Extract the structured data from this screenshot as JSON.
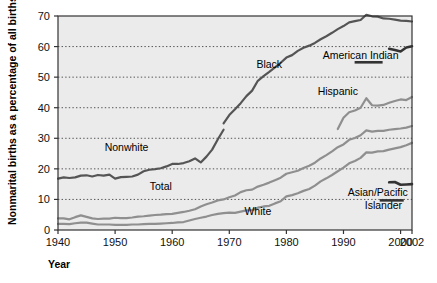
{
  "chart_data": {
    "type": "line",
    "title": "",
    "xlabel": "Year",
    "ylabel": "Nonmarital births as a percentage of all births",
    "xlim": [
      1940,
      2002
    ],
    "ylim": [
      0,
      70
    ],
    "xticks": [
      1940,
      1950,
      1960,
      1970,
      1980,
      1990,
      2000,
      2002
    ],
    "xticklabels": [
      "1940",
      "1950",
      "1960",
      "1970",
      "1980",
      "1990",
      "2000",
      "2002"
    ],
    "yticks": [
      0,
      10,
      20,
      30,
      40,
      50,
      60,
      70
    ],
    "yticklabels": [
      "0",
      "10",
      "20",
      "30",
      "40",
      "50",
      "60",
      "70"
    ],
    "grid": "horizontal-dotted",
    "legend_position": "inline-annotations",
    "plot_background": "#ebebeb",
    "series": [
      {
        "name": "Black",
        "color": "#555555",
        "label_x": 1977,
        "label_y": 53,
        "x": [
          1969,
          1970,
          1971,
          1972,
          1973,
          1974,
          1975,
          1976,
          1977,
          1978,
          1979,
          1980,
          1981,
          1982,
          1983,
          1984,
          1985,
          1986,
          1987,
          1988,
          1989,
          1990,
          1991,
          1992,
          1993,
          1994,
          1995,
          1996,
          1997,
          1998,
          1999,
          2000,
          2001,
          2002
        ],
        "values": [
          34.9,
          37.6,
          39.5,
          41.5,
          43.8,
          45.6,
          48.8,
          50.3,
          51.7,
          53.2,
          54.7,
          56.4,
          57.2,
          58.6,
          59.6,
          60.3,
          61.2,
          62.4,
          63.4,
          64.5,
          65.7,
          66.7,
          67.9,
          68.3,
          68.7,
          70.4,
          69.9,
          69.8,
          69.2,
          69.1,
          68.8,
          68.5,
          68.4,
          68.2
        ]
      },
      {
        "name": "Nonwhite",
        "color": "#555555",
        "label_x": 1952,
        "label_y": 26,
        "x": [
          1940,
          1941,
          1942,
          1943,
          1944,
          1945,
          1946,
          1947,
          1948,
          1949,
          1950,
          1951,
          1952,
          1953,
          1954,
          1955,
          1956,
          1957,
          1958,
          1959,
          1960,
          1961,
          1962,
          1963,
          1964,
          1965,
          1966,
          1967,
          1968,
          1969
        ],
        "values": [
          16.8,
          17.2,
          17.0,
          17.2,
          17.8,
          17.9,
          17.5,
          18.0,
          17.8,
          18.1,
          16.8,
          17.3,
          17.4,
          17.5,
          18.1,
          19.2,
          19.7,
          19.9,
          20.2,
          20.8,
          21.6,
          21.6,
          21.9,
          22.5,
          23.4,
          22.1,
          24.0,
          26.3,
          29.7,
          32.8
        ]
      },
      {
        "name": "Hispanic",
        "color": "#8f8f8f",
        "label_x": 1989,
        "label_y": 44,
        "x": [
          1989,
          1990,
          1991,
          1992,
          1993,
          1994,
          1995,
          1996,
          1997,
          1998,
          1999,
          2000,
          2001,
          2002
        ],
        "values": [
          33.0,
          36.7,
          38.5,
          39.1,
          40.0,
          43.1,
          40.8,
          40.7,
          40.9,
          41.6,
          42.2,
          42.7,
          42.5,
          43.5
        ]
      },
      {
        "name": "American Indian",
        "color": "#333333",
        "label_x": 1993,
        "label_y": 56,
        "x": [
          1998,
          1999,
          2000,
          2001,
          2002
        ],
        "values": [
          59.3,
          58.9,
          58.4,
          59.7,
          60.1
        ]
      },
      {
        "name": "Total",
        "color": "#8f8f8f",
        "label_x": 1958,
        "label_y": 13,
        "x": [
          1940,
          1941,
          1942,
          1943,
          1944,
          1945,
          1946,
          1947,
          1948,
          1949,
          1950,
          1951,
          1952,
          1953,
          1954,
          1955,
          1956,
          1957,
          1958,
          1959,
          1960,
          1961,
          1962,
          1963,
          1964,
          1965,
          1966,
          1967,
          1968,
          1969,
          1970,
          1971,
          1972,
          1973,
          1974,
          1975,
          1976,
          1977,
          1978,
          1979,
          1980,
          1981,
          1982,
          1983,
          1984,
          1985,
          1986,
          1987,
          1988,
          1989,
          1990,
          1991,
          1992,
          1993,
          1994,
          1995,
          1996,
          1997,
          1998,
          1999,
          2000,
          2001,
          2002
        ],
        "values": [
          3.8,
          3.8,
          3.5,
          4.2,
          4.8,
          4.3,
          3.8,
          3.6,
          3.7,
          3.7,
          4.0,
          3.9,
          3.9,
          4.1,
          4.4,
          4.5,
          4.7,
          4.9,
          5.0,
          5.2,
          5.3,
          5.6,
          5.9,
          6.3,
          6.8,
          7.7,
          8.4,
          9.0,
          9.7,
          10.0,
          10.7,
          11.3,
          12.4,
          13.0,
          13.2,
          14.2,
          14.8,
          15.5,
          16.3,
          17.1,
          18.4,
          18.9,
          19.4,
          20.3,
          21.0,
          22.0,
          23.4,
          24.5,
          25.7,
          27.1,
          28.0,
          29.5,
          30.1,
          31.0,
          32.6,
          32.2,
          32.4,
          32.4,
          32.8,
          33.0,
          33.2,
          33.5,
          34.0
        ]
      },
      {
        "name": "White",
        "color": "#8f8f8f",
        "label_x": 1975,
        "label_y": 5,
        "x": [
          1940,
          1941,
          1942,
          1943,
          1944,
          1945,
          1946,
          1947,
          1948,
          1949,
          1950,
          1951,
          1952,
          1953,
          1954,
          1955,
          1956,
          1957,
          1958,
          1959,
          1960,
          1961,
          1962,
          1963,
          1964,
          1965,
          1966,
          1967,
          1968,
          1969,
          1970,
          1971,
          1972,
          1973,
          1974,
          1975,
          1976,
          1977,
          1978,
          1979,
          1980,
          1981,
          1982,
          1983,
          1984,
          1985,
          1986,
          1987,
          1988,
          1989,
          1990,
          1991,
          1992,
          1993,
          1994,
          1995,
          1996,
          1997,
          1998,
          1999,
          2000,
          2001,
          2002
        ],
        "values": [
          2.0,
          2.0,
          1.9,
          2.2,
          2.4,
          2.4,
          2.1,
          1.8,
          1.8,
          1.8,
          1.7,
          1.7,
          1.7,
          1.8,
          1.8,
          1.9,
          2.0,
          2.0,
          2.1,
          2.2,
          2.3,
          2.5,
          2.6,
          3.1,
          3.6,
          4.0,
          4.4,
          4.9,
          5.3,
          5.5,
          5.7,
          5.6,
          6.0,
          6.4,
          6.5,
          7.3,
          7.7,
          7.9,
          8.7,
          9.4,
          11.0,
          11.4,
          12.0,
          12.8,
          13.4,
          14.5,
          15.9,
          16.9,
          18.0,
          19.2,
          20.4,
          21.8,
          22.6,
          23.6,
          25.4,
          25.3,
          25.7,
          25.8,
          26.3,
          26.7,
          27.1,
          27.7,
          28.5
        ]
      },
      {
        "name": "Asian/Pacific Islander",
        "color": "#333333",
        "label_x": 1996,
        "label_y": 11,
        "x": [
          1998,
          1999,
          2000,
          2001,
          2002
        ],
        "values": [
          15.6,
          15.7,
          14.8,
          14.9,
          15.0
        ]
      }
    ],
    "annotations": [
      {
        "text": "Black",
        "x": 1977,
        "y": 53
      },
      {
        "text": "American Indian",
        "x": 1993,
        "y": 56
      },
      {
        "text": "Nonwhite",
        "x": 1952,
        "y": 26
      },
      {
        "text": "Hispanic",
        "x": 1989,
        "y": 44
      },
      {
        "text": "Total",
        "x": 1958,
        "y": 13
      },
      {
        "text": "White",
        "x": 1975,
        "y": 5
      },
      {
        "text": "Asian/Pacific",
        "x": 1996,
        "y": 11
      },
      {
        "text": "Islander",
        "x": 1997,
        "y": 7
      }
    ]
  },
  "labels": {
    "ylabel": "Nonmarital births as a percentage of all births",
    "xlabel": "Year",
    "series_black": "Black",
    "series_american_indian": "American Indian",
    "series_nonwhite": "Nonwhite",
    "series_hispanic": "Hispanic",
    "series_total": "Total",
    "series_white": "White",
    "series_asian_1": "Asian/Pacific",
    "series_asian_2": "Islander",
    "tick_x_1": "1940",
    "tick_x_2": "1950",
    "tick_x_3": "1960",
    "tick_x_4": "1970",
    "tick_x_5": "1980",
    "tick_x_6": "1990",
    "tick_x_7": "2000",
    "tick_x_8": "2002",
    "tick_y_0": "0",
    "tick_y_10": "10",
    "tick_y_20": "20",
    "tick_y_30": "30",
    "tick_y_40": "40",
    "tick_y_50": "50",
    "tick_y_60": "60",
    "tick_y_70": "70"
  }
}
